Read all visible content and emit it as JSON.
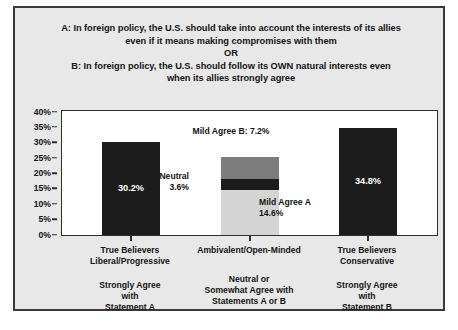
{
  "chart_data": {
    "type": "bar",
    "title_lines": [
      "A: In foreign policy, the U.S. should take into account the interests of its allies",
      "even if it means making compromises with them",
      "OR",
      "B: In foreign policy, the U.S. should follow its OWN natural interests even",
      "when its allies strongly agree"
    ],
    "xlabel": "",
    "ylabel": "",
    "ylim": [
      0,
      40
    ],
    "ytick_labels": [
      "40%",
      "35%",
      "30%",
      "25%",
      "20%",
      "15%",
      "10%",
      "5%",
      "0%"
    ],
    "ytick_values": [
      40,
      35,
      30,
      25,
      20,
      15,
      10,
      5,
      0
    ],
    "grid": false,
    "legend": "none",
    "categories": [
      "True Believers Liberal/Progressive",
      "Ambivalent/Open-Minded",
      "True Believers Conservative"
    ],
    "category_labels": [
      {
        "top": [
          "True Believers",
          "Liberal/Progressive"
        ],
        "sub": [
          "Strongly Agree",
          "with",
          "Statement A"
        ]
      },
      {
        "top": [
          "Ambivalent/Open-Minded"
        ],
        "sub": [
          "Neutral or",
          "Somewhat Agree with",
          "Statements A or B"
        ]
      },
      {
        "top": [
          "True Believers",
          "Conservative"
        ],
        "sub": [
          "Strongly Agree",
          "with",
          "Statement B"
        ]
      }
    ],
    "bars": [
      {
        "category": "True Believers Liberal/Progressive",
        "total": 30.2,
        "stacked": false,
        "segments": [
          {
            "name": "Strongly Agree with Statement A",
            "value": 30.2,
            "label": "30.2%",
            "color": "#1c1c1c",
            "label_color": "#ffffff"
          }
        ]
      },
      {
        "category": "Ambivalent/Open-Minded",
        "total": 25.4,
        "stacked": true,
        "segments": [
          {
            "name": "Mild Agree A",
            "value": 14.6,
            "label": "14.6%",
            "color": "#d4d4d4",
            "label_color": "#141414"
          },
          {
            "name": "Neutral",
            "value": 3.6,
            "label": "3.6%",
            "color": "#1c1c1c",
            "label_color": "#141414"
          },
          {
            "name": "Mild Agree B",
            "value": 7.2,
            "label": "7.2%",
            "color": "#7d7d7d",
            "label_color": "#141414"
          }
        ]
      },
      {
        "category": "True Believers Conservative",
        "total": 34.8,
        "stacked": false,
        "segments": [
          {
            "name": "Strongly Agree with Statement B",
            "value": 34.8,
            "label": "34.8%",
            "color": "#1c1c1c",
            "label_color": "#ffffff"
          }
        ]
      }
    ],
    "annotations": [
      {
        "name": "mild-agree-b",
        "text": "Mild Agree B: 7.2%",
        "position": "above-bar-2"
      },
      {
        "name": "neutral",
        "lines": [
          "Neutral",
          "3.6%"
        ],
        "position": "left-of-bar-2"
      },
      {
        "name": "mild-agree-a",
        "lines": [
          "Mild Agree A",
          "14.6%"
        ],
        "position": "right-of-bar-2"
      }
    ],
    "colors": {
      "dark": "#1c1c1c",
      "medium_gray": "#7d7d7d",
      "light_gray": "#d4d4d4",
      "frame_background": "#e8e8e8",
      "plot_background": "#ffffff",
      "border": "#2e2e2e",
      "text": "#141414"
    }
  }
}
